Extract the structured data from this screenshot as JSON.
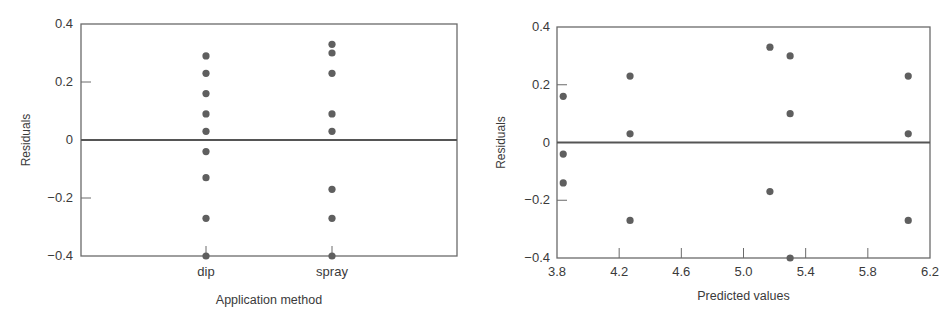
{
  "chart_data": [
    {
      "type": "scatter",
      "title": "",
      "xlabel": "Application method",
      "ylabel": "Residuals",
      "categories": [
        "dip",
        "spray"
      ],
      "ylim": [
        -0.4,
        0.4
      ],
      "yticks": [
        "0.4",
        "0.2",
        "0",
        "-0.2",
        "-0.4"
      ],
      "ytick_values": [
        0.4,
        0.2,
        0,
        -0.2,
        -0.4
      ],
      "reference_line": 0,
      "grid": false,
      "series": [
        {
          "name": "dip",
          "values": [
            0.29,
            0.23,
            0.16,
            0.09,
            0.03,
            -0.04,
            -0.13,
            -0.27,
            -0.4
          ]
        },
        {
          "name": "spray",
          "values": [
            0.33,
            0.3,
            0.23,
            0.09,
            0.03,
            -0.17,
            -0.27,
            -0.4
          ]
        }
      ]
    },
    {
      "type": "scatter",
      "title": "",
      "xlabel": "Predicted values",
      "ylabel": "Residuals",
      "xlim": [
        3.8,
        6.2
      ],
      "ylim": [
        -0.4,
        0.4
      ],
      "xticks": [
        "3.8",
        "4.2",
        "4.6",
        "5.0",
        "5.4",
        "5.8",
        "6.2"
      ],
      "xtick_values": [
        3.8,
        4.2,
        4.6,
        5.0,
        5.4,
        5.8,
        6.2
      ],
      "yticks": [
        "0.4",
        "0.2",
        "0",
        "-0.2",
        "-0.4"
      ],
      "ytick_values": [
        0.4,
        0.2,
        0,
        -0.2,
        -0.4
      ],
      "reference_line": 0,
      "grid": false,
      "points": [
        {
          "x": 3.84,
          "y": 0.16
        },
        {
          "x": 3.84,
          "y": -0.04
        },
        {
          "x": 3.84,
          "y": -0.14
        },
        {
          "x": 4.27,
          "y": 0.23
        },
        {
          "x": 4.27,
          "y": 0.03
        },
        {
          "x": 4.27,
          "y": -0.27
        },
        {
          "x": 5.17,
          "y": 0.33
        },
        {
          "x": 5.17,
          "y": -0.17
        },
        {
          "x": 5.3,
          "y": 0.3
        },
        {
          "x": 5.3,
          "y": 0.1
        },
        {
          "x": 5.3,
          "y": -0.4
        },
        {
          "x": 6.06,
          "y": 0.23
        },
        {
          "x": 6.06,
          "y": 0.03
        },
        {
          "x": 6.06,
          "y": -0.27
        }
      ]
    }
  ],
  "colors": {
    "points": "#5f5f5f",
    "axis": "#6a6a6a",
    "zero_line": "#555555"
  }
}
